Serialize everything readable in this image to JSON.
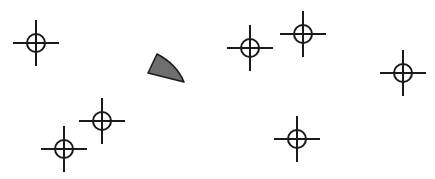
{
  "canvas": {
    "width": 435,
    "height": 179,
    "background": "#ffffff"
  },
  "style": {
    "stroke": "#1a1a1a",
    "fill_shape": "#6e6e6e"
  },
  "crosshairs": [
    {
      "id": "target-1",
      "cx": 36,
      "cy": 43,
      "r": 9,
      "arm": 23
    },
    {
      "id": "target-2",
      "cx": 64,
      "cy": 149,
      "r": 9,
      "arm": 23
    },
    {
      "id": "target-3",
      "cx": 102,
      "cy": 121,
      "r": 9,
      "arm": 23
    },
    {
      "id": "target-4",
      "cx": 250,
      "cy": 48,
      "r": 9,
      "arm": 23
    },
    {
      "id": "target-5",
      "cx": 303,
      "cy": 34,
      "r": 9,
      "arm": 23
    },
    {
      "id": "target-6",
      "cx": 403,
      "cy": 73,
      "r": 9,
      "arm": 23
    },
    {
      "id": "target-7",
      "cx": 297,
      "cy": 139,
      "r": 9,
      "arm": 23
    }
  ],
  "shape": {
    "id": "wedge-marker",
    "points": [
      [
        157,
        54
      ],
      [
        148,
        73
      ],
      [
        184,
        82
      ]
    ],
    "fill": "#6e6e6e",
    "stroke": "#1a1a1a"
  }
}
